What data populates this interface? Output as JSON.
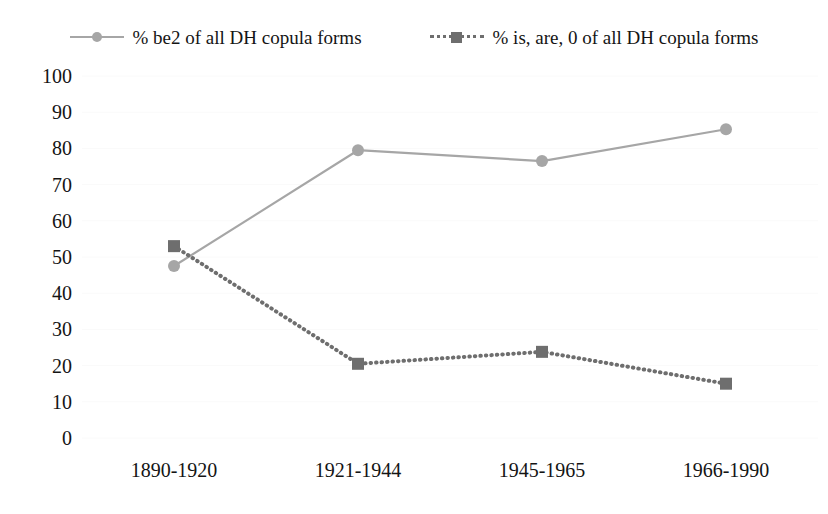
{
  "chart_data": {
    "type": "line",
    "title": "",
    "subtitle": "",
    "xlabel": "",
    "ylabel": "",
    "categories": [
      "1890-1920",
      "1921-1944",
      "1945-1965",
      "1966-1990"
    ],
    "ylim": [
      0,
      100
    ],
    "ytick_step": 10,
    "yticks": [
      "100",
      "90",
      "80",
      "70",
      "60",
      "50",
      "40",
      "30",
      "20",
      "10",
      "0"
    ],
    "grid": "horizontal-faint",
    "legend_position": "top-center",
    "series": [
      {
        "name": "% be2 of all DH copula forms",
        "values": [
          47.5,
          79.5,
          76.5,
          85.3
        ],
        "color": "#a6a6a6",
        "line_style": "solid",
        "marker": "circle"
      },
      {
        "name": "% is, are, 0 of all DH copula forms",
        "values": [
          53.0,
          20.5,
          23.8,
          15.0
        ],
        "color": "#6e6e6e",
        "line_style": "dotted",
        "marker": "square"
      }
    ]
  },
  "legend": {
    "entries": [
      {
        "label": "% be2 of all DH copula forms"
      },
      {
        "label": "% is, are, 0 of all DH copula forms"
      }
    ]
  }
}
